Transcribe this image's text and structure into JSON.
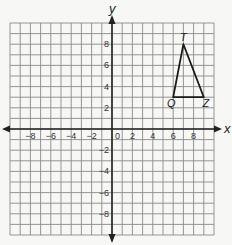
{
  "axes": {
    "x_label": "x",
    "y_label": "y",
    "x_range": [
      -10,
      10
    ],
    "y_range": [
      -10,
      10
    ],
    "grid_step": 1,
    "origin_label": "0",
    "x_ticks": [
      {
        "value": -8,
        "label": "−8"
      },
      {
        "value": -6,
        "label": "−6"
      },
      {
        "value": -4,
        "label": "−4"
      },
      {
        "value": -2,
        "label": "−2"
      },
      {
        "value": 2,
        "label": "2"
      },
      {
        "value": 4,
        "label": "4"
      },
      {
        "value": 6,
        "label": "6"
      },
      {
        "value": 8,
        "label": "8"
      }
    ],
    "y_ticks": [
      {
        "value": 8,
        "label": "8"
      },
      {
        "value": 6,
        "label": "6"
      },
      {
        "value": 4,
        "label": "4"
      },
      {
        "value": 2,
        "label": "2"
      },
      {
        "value": -2,
        "label": "−2"
      },
      {
        "value": -4,
        "label": "−4"
      },
      {
        "value": -6,
        "label": "−6"
      },
      {
        "value": -8,
        "label": "−8"
      }
    ]
  },
  "triangle": {
    "name": "TQZ",
    "vertices": [
      {
        "label": "T",
        "x": 7,
        "y": 8
      },
      {
        "label": "Q",
        "x": 6,
        "y": 3
      },
      {
        "label": "Z",
        "x": 9,
        "y": 3
      }
    ]
  },
  "colors": {
    "grid": "#8a8a8a",
    "axis": "#222222",
    "shape": "#1a1a1a",
    "background": "#f7f7f5"
  }
}
